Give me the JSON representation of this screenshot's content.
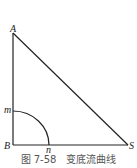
{
  "figure": {
    "caption": "图 7-58　变底流曲线",
    "labels": {
      "A": "A",
      "B": "B",
      "S": "S",
      "m": "m",
      "n": "n"
    },
    "colors": {
      "stroke": "#222222",
      "caption": "#555555"
    }
  }
}
